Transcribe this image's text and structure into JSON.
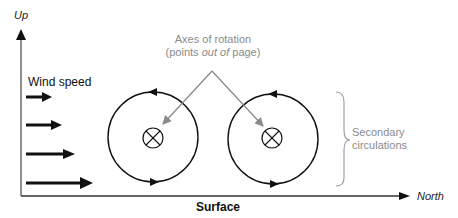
{
  "axes": {
    "y_label": "Up",
    "x_label": "North",
    "x_title": "Surface"
  },
  "labels": {
    "wind_speed": "Wind speed",
    "rotation_axes_line1": "Axes of rotation",
    "rotation_axes_line2_pre": "(points ",
    "rotation_axes_line2_em": "out of",
    "rotation_axes_line2_post": " page)",
    "secondary_line1": "Secondary",
    "secondary_line2": "circulations"
  },
  "colors": {
    "primary": "#111111",
    "annotation": "#8a8a8a"
  },
  "wind_arrows": [
    {
      "y": 128,
      "length": 24
    },
    {
      "y": 152,
      "length": 32
    },
    {
      "y": 174,
      "length": 44
    },
    {
      "y": 183,
      "length": 64
    }
  ],
  "circulations": [
    {
      "cx": 153,
      "cy": 137,
      "r": 45,
      "rotation": "counterclockwise-top-left"
    },
    {
      "cx": 273,
      "cy": 139,
      "r": 45,
      "rotation": "counterclockwise-top-left"
    }
  ]
}
